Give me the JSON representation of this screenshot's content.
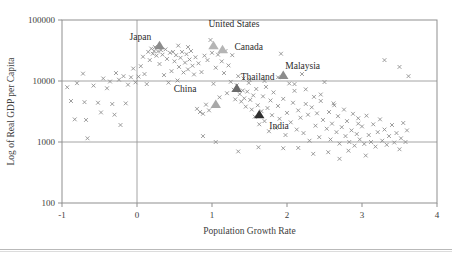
{
  "chart_data": {
    "type": "scatter",
    "title": "",
    "xlabel": "Population Growth Rate",
    "ylabel": "Log of Real GDP per Capita",
    "xlim": [
      -1,
      4
    ],
    "ylim": [
      100,
      100000
    ],
    "yscale": "log",
    "xticks": [
      "-1",
      "0",
      "1",
      "2",
      "3",
      "4"
    ],
    "xtick_values": [
      -1,
      0,
      1,
      2,
      3,
      4
    ],
    "yticks": [
      "100000",
      "10000",
      "1000",
      "100"
    ],
    "ytick_values": [
      100000,
      10000,
      1000,
      100
    ],
    "grid": "gridlines at y=10000, y=1000 and x=0",
    "legend": "none",
    "marker_styles": {
      "generic": "gray x cross",
      "highlighted": "filled triangle"
    },
    "annotations": [
      {
        "label": "Japan",
        "x": 0.3,
        "y": 33000,
        "label_dx": -30,
        "label_dy": -9,
        "marker": "triangle",
        "color": "#8c8c8c"
      },
      {
        "label": "United States",
        "x": 1.02,
        "y": 33000,
        "label_dx": -5,
        "label_dy": -22,
        "marker": "triangle",
        "color": "#b5b5b5"
      },
      {
        "label": "Canada",
        "x": 1.14,
        "y": 28500,
        "label_dx": 12,
        "label_dy": -3,
        "marker": "triangle",
        "color": "#b5b5b5"
      },
      {
        "label": "Malaysia",
        "x": 1.95,
        "y": 10800,
        "label_dx": 2,
        "label_dy": -10,
        "marker": "triangle",
        "color": "#8c8c8c"
      },
      {
        "label": "Thailand",
        "x": 1.33,
        "y": 6600,
        "label_dx": 4,
        "label_dy": -12,
        "marker": "triangle",
        "color": "#6b6b6b"
      },
      {
        "label": "China",
        "x": 1.05,
        "y": 3600,
        "label_dx": -42,
        "label_dy": -16,
        "marker": "triangle",
        "color": "#a8a8a8"
      },
      {
        "label": "India",
        "x": 1.63,
        "y": 2450,
        "label_dx": 10,
        "label_dy": 11,
        "marker": "triangle",
        "color": "#2e2e2e"
      }
    ],
    "points": [
      [
        -0.93,
        7900
      ],
      [
        -0.88,
        4700
      ],
      [
        -0.83,
        2350
      ],
      [
        -0.8,
        9200
      ],
      [
        -0.72,
        13200
      ],
      [
        -0.7,
        4500
      ],
      [
        -0.68,
        2300
      ],
      [
        -0.66,
        1150
      ],
      [
        -0.58,
        8400
      ],
      [
        -0.52,
        4400
      ],
      [
        -0.48,
        3050
      ],
      [
        -0.45,
        11000
      ],
      [
        -0.4,
        7600
      ],
      [
        -0.36,
        9800
      ],
      [
        -0.33,
        4200
      ],
      [
        -0.3,
        2800
      ],
      [
        -0.28,
        13500
      ],
      [
        -0.24,
        10500
      ],
      [
        -0.22,
        1900
      ],
      [
        -0.18,
        12000
      ],
      [
        -0.15,
        4300
      ],
      [
        -0.12,
        8700
      ],
      [
        -0.08,
        11500
      ],
      [
        -0.05,
        16000
      ],
      [
        -0.02,
        9500
      ],
      [
        0.02,
        11800
      ],
      [
        0.05,
        17500
      ],
      [
        0.08,
        25000
      ],
      [
        0.1,
        13000
      ],
      [
        0.13,
        8900
      ],
      [
        0.15,
        30000
      ],
      [
        0.17,
        22000
      ],
      [
        0.19,
        34000
      ],
      [
        0.21,
        28000
      ],
      [
        0.23,
        31000
      ],
      [
        0.24,
        36000
      ],
      [
        0.26,
        26000
      ],
      [
        0.28,
        30500
      ],
      [
        0.3,
        19000
      ],
      [
        0.32,
        32000
      ],
      [
        0.34,
        27000
      ],
      [
        0.36,
        12500
      ],
      [
        0.38,
        33000
      ],
      [
        0.4,
        23000
      ],
      [
        0.42,
        9400
      ],
      [
        0.44,
        29000
      ],
      [
        0.46,
        14500
      ],
      [
        0.48,
        30000
      ],
      [
        0.5,
        21000
      ],
      [
        0.52,
        26500
      ],
      [
        0.54,
        10200
      ],
      [
        0.56,
        17000
      ],
      [
        0.58,
        24000
      ],
      [
        0.6,
        30000
      ],
      [
        0.62,
        13800
      ],
      [
        0.64,
        20000
      ],
      [
        0.66,
        27500
      ],
      [
        0.68,
        15500
      ],
      [
        0.7,
        22500
      ],
      [
        0.72,
        31000
      ],
      [
        0.74,
        17800
      ],
      [
        0.76,
        12800
      ],
      [
        0.78,
        24500
      ],
      [
        0.8,
        3500
      ],
      [
        0.82,
        19500
      ],
      [
        0.84,
        3100
      ],
      [
        0.86,
        14000
      ],
      [
        0.88,
        2900
      ],
      [
        0.9,
        26000
      ],
      [
        0.92,
        4100
      ],
      [
        0.94,
        22000
      ],
      [
        0.96,
        3300
      ],
      [
        0.98,
        47000
      ],
      [
        1.0,
        29000
      ],
      [
        1.02,
        9000
      ],
      [
        1.05,
        16500
      ],
      [
        1.08,
        27000
      ],
      [
        1.1,
        5400
      ],
      [
        1.13,
        21000
      ],
      [
        1.16,
        13500
      ],
      [
        1.18,
        31000
      ],
      [
        1.2,
        6300
      ],
      [
        1.22,
        18000
      ],
      [
        1.25,
        9700
      ],
      [
        1.27,
        26500
      ],
      [
        1.29,
        7200
      ],
      [
        1.31,
        5000
      ],
      [
        1.33,
        8500
      ],
      [
        1.35,
        12000
      ],
      [
        1.37,
        6100
      ],
      [
        1.39,
        4600
      ],
      [
        1.41,
        7000
      ],
      [
        1.43,
        5200
      ],
      [
        1.45,
        3800
      ],
      [
        1.47,
        6700
      ],
      [
        1.49,
        9300
      ],
      [
        1.51,
        4900
      ],
      [
        1.53,
        3400
      ],
      [
        1.55,
        5800
      ],
      [
        1.57,
        2600
      ],
      [
        1.59,
        7400
      ],
      [
        1.61,
        4000
      ],
      [
        1.63,
        1950
      ],
      [
        1.66,
        3200
      ],
      [
        1.68,
        5600
      ],
      [
        1.7,
        2200
      ],
      [
        1.72,
        8000
      ],
      [
        1.74,
        3600
      ],
      [
        1.76,
        1500
      ],
      [
        1.78,
        4800
      ],
      [
        1.8,
        2750
      ],
      [
        1.82,
        6500
      ],
      [
        1.85,
        1700
      ],
      [
        1.88,
        3900
      ],
      [
        1.9,
        2400
      ],
      [
        1.92,
        28000
      ],
      [
        1.95,
        5100
      ],
      [
        1.98,
        1300
      ],
      [
        2.0,
        3000
      ],
      [
        2.03,
        9100
      ],
      [
        2.05,
        2100
      ],
      [
        2.08,
        4400
      ],
      [
        2.1,
        6900
      ],
      [
        2.13,
        1600
      ],
      [
        2.15,
        3300
      ],
      [
        2.18,
        2500
      ],
      [
        2.2,
        13000
      ],
      [
        2.22,
        1400
      ],
      [
        2.25,
        4200
      ],
      [
        2.28,
        2800
      ],
      [
        2.3,
        1050
      ],
      [
        2.33,
        3700
      ],
      [
        2.36,
        5500
      ],
      [
        2.38,
        1850
      ],
      [
        2.4,
        2950
      ],
      [
        2.43,
        1200
      ],
      [
        2.45,
        4700
      ],
      [
        2.48,
        2300
      ],
      [
        2.5,
        9600
      ],
      [
        2.53,
        1650
      ],
      [
        2.56,
        3100
      ],
      [
        2.58,
        1100
      ],
      [
        2.6,
        2000
      ],
      [
        2.63,
        4000
      ],
      [
        2.66,
        1450
      ],
      [
        2.68,
        2650
      ],
      [
        2.7,
        940
      ],
      [
        2.73,
        1750
      ],
      [
        2.76,
        3400
      ],
      [
        2.78,
        1250
      ],
      [
        2.8,
        2200
      ],
      [
        2.83,
        1000
      ],
      [
        2.86,
        1550
      ],
      [
        2.88,
        2900
      ],
      [
        2.9,
        870
      ],
      [
        2.93,
        1350
      ],
      [
        2.95,
        2450
      ],
      [
        2.97,
        1100
      ],
      [
        3.0,
        1800
      ],
      [
        3.03,
        930
      ],
      [
        3.06,
        2700
      ],
      [
        3.09,
        1300
      ],
      [
        3.12,
        1000
      ],
      [
        3.15,
        1950
      ],
      [
        3.18,
        840
      ],
      [
        3.21,
        1450
      ],
      [
        3.24,
        2350
      ],
      [
        3.27,
        1050
      ],
      [
        3.3,
        1600
      ],
      [
        3.33,
        900
      ],
      [
        3.36,
        1250
      ],
      [
        3.4,
        1900
      ],
      [
        3.43,
        980
      ],
      [
        3.46,
        1400
      ],
      [
        3.5,
        760
      ],
      [
        3.52,
        1150
      ],
      [
        3.55,
        2050
      ],
      [
        3.58,
        1000
      ],
      [
        3.6,
        1550
      ],
      [
        3.62,
        12000
      ],
      [
        3.5,
        17000
      ],
      [
        3.3,
        22000
      ],
      [
        2.95,
        2000
      ],
      [
        2.7,
        530
      ],
      [
        2.35,
        640
      ],
      [
        1.95,
        790
      ],
      [
        1.62,
        820
      ],
      [
        1.35,
        700
      ],
      [
        2.55,
        680
      ],
      [
        3.05,
        600
      ],
      [
        1.05,
        1000
      ],
      [
        0.88,
        1250
      ],
      [
        2.1,
        8900
      ],
      [
        2.25,
        7300
      ],
      [
        2.45,
        6000
      ],
      [
        2.62,
        4300
      ],
      [
        1.88,
        11500
      ],
      [
        1.7,
        10000
      ],
      [
        1.5,
        10500
      ],
      [
        1.42,
        11000
      ],
      [
        0.55,
        38000
      ],
      [
        0.68,
        36000
      ],
      [
        2.15,
        800
      ],
      [
        2.82,
        720
      ]
    ]
  }
}
